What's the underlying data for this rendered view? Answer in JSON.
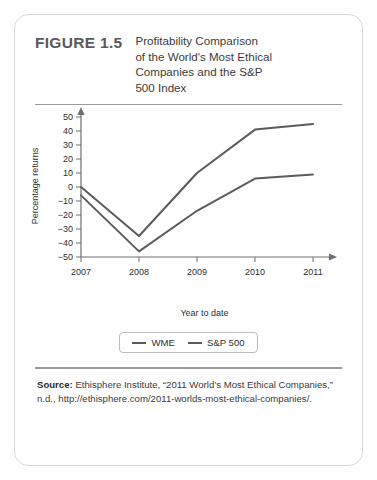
{
  "figure": {
    "number": "FIGURE 1.5",
    "title_lines": [
      "Profitability Comparison",
      "of the World's Most Ethical",
      "Companies and the S&P",
      "500 Index"
    ]
  },
  "legend": {
    "items": [
      {
        "label": "WME",
        "color": "#5b5b5b"
      },
      {
        "label": "S&P 500",
        "color": "#5b5b5b"
      }
    ]
  },
  "source": {
    "label": "Source:",
    "text": " Ethisphere Institute, “2011 World’s Most Ethical Companies,” n.d., http://ethisphere.com/2011-worlds-most-ethical-companies/."
  },
  "chart_data": {
    "type": "line",
    "title": "Profitability Comparison of the World's Most Ethical Companies and the S&P 500 Index",
    "xlabel": "Year to date",
    "ylabel": "Percentage returns",
    "x": [
      "2007",
      "2008",
      "2009",
      "2010",
      "2011"
    ],
    "xticklabels": [
      "2007",
      "2008",
      "2009",
      "2010",
      "2011"
    ],
    "yticklabels": [
      "50",
      "40",
      "30",
      "20",
      "10",
      "0",
      "−10",
      "−20",
      "−30",
      "−40",
      "−50"
    ],
    "yticks": [
      50,
      40,
      30,
      20,
      10,
      0,
      -10,
      -20,
      -30,
      -40,
      -50
    ],
    "ylim": [
      -50,
      55
    ],
    "grid": false,
    "legend_position": "bottom",
    "series": [
      {
        "name": "WME",
        "color": "#5b5b5b",
        "values": [
          0,
          -35,
          10,
          41,
          45
        ]
      },
      {
        "name": "S&P 500",
        "color": "#5b5b5b",
        "values": [
          -6,
          -46,
          -17,
          6,
          9
        ]
      }
    ]
  }
}
